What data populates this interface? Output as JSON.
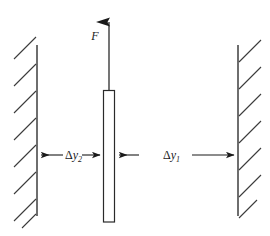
{
  "figure": {
    "type": "mechanics-free-body-diagram",
    "background_color": "#ffffff",
    "line_color": "#1a1a1a",
    "labels": {
      "force": "F",
      "gap_left_delta": "Δ",
      "gap_left_var": "y",
      "gap_left_sub": "2",
      "gap_right_delta": "Δ",
      "gap_right_var": "y",
      "gap_right_sub": "1"
    },
    "elements": {
      "left_wall_name": "left-fixed-wall",
      "right_wall_name": "right-fixed-wall",
      "bar_name": "central-vertical-bar",
      "force_arrow_name": "applied-force-arrow",
      "left_dimension_name": "gap-dimension-left",
      "right_dimension_name": "gap-dimension-right"
    },
    "geometry": {
      "left_wall_x": 37,
      "right_wall_x": 238,
      "wall_top_y": 45,
      "wall_bottom_y": 216,
      "bar_left_x": 103,
      "bar_right_x": 115,
      "bar_top_y": 90,
      "bar_bottom_y": 222,
      "dimension_line_y": 155,
      "force_arrow_tip_y": 8,
      "force_arrow_base_y": 90
    }
  }
}
